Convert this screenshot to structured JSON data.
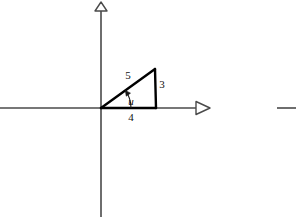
{
  "figure": {
    "background_color": "#ffffff",
    "axis_color": "#4a4a4a",
    "triangle_color": "#000000",
    "label_color": "#111111"
  },
  "axes": {
    "x_axis": {
      "name": "x-axis",
      "from_x": 0,
      "to_x": 196,
      "y": 108,
      "arrow": "right",
      "arrow_style": "hollow-triangle"
    },
    "y_axis": {
      "name": "y-axis",
      "x": 101,
      "from_y": 217,
      "to_y": 11,
      "arrow": "up",
      "arrow_style": "hollow-triangle"
    },
    "origin": {
      "x": 101,
      "y": 108
    }
  },
  "triangle": {
    "vertices": [
      {
        "name": "origin-vertex",
        "x": 101,
        "y": 108
      },
      {
        "name": "apex-vertex",
        "x": 155,
        "y": 69
      },
      {
        "name": "right-angle-vertex",
        "x": 156,
        "y": 108
      }
    ],
    "sides": [
      {
        "name": "hypotenuse",
        "label": "5",
        "label_x": 128,
        "label_y": 79
      },
      {
        "name": "opposite-leg",
        "label": "3",
        "label_x": 162,
        "label_y": 88
      },
      {
        "name": "adjacent-leg",
        "label": "4",
        "label_x": 131,
        "label_y": 121
      }
    ],
    "angle": {
      "name": "angle-u",
      "label": "u",
      "label_x": 131,
      "label_y": 105,
      "arc_cx": 101,
      "arc_cy": 108,
      "arc_r": 30
    }
  },
  "adjacent_figure_fragment": {
    "name": "neighbor-axis-fragment",
    "x1": 277,
    "x2": 296,
    "y": 108
  },
  "chart_data": {
    "type": "diagram",
    "annotations": [
      {
        "text": "5",
        "meaning": "hypotenuse length"
      },
      {
        "text": "3",
        "meaning": "vertical leg (opposite side) length"
      },
      {
        "text": "4",
        "meaning": "horizontal leg (adjacent side) length"
      },
      {
        "text": "u",
        "meaning": "angle at origin between positive x-axis and hypotenuse"
      }
    ],
    "xlabel": "",
    "ylabel": "",
    "grid": false,
    "legend": "none"
  }
}
